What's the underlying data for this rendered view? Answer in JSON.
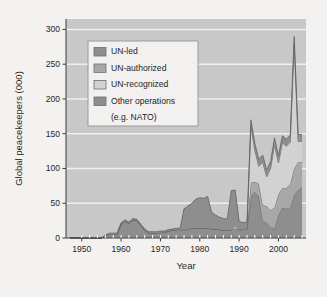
{
  "figure": {
    "background_color": "#f3f2f0",
    "plot_background_color": "#c8c8c8",
    "gridline_color": "#f0f0ee"
  },
  "legend": {
    "name": "series-legend",
    "background_color": "#f2f1ef",
    "border_color": "#9a9a9a",
    "items": [
      {
        "label": "UN-led",
        "color": "#8e8e8e"
      },
      {
        "label": "UN-authorized",
        "color": "#a8a8a8"
      },
      {
        "label": "UN-recognized",
        "color": "#d2d2d2"
      },
      {
        "label": "Other operations",
        "color": "#8e8e8e"
      },
      {
        "label": "(e.g. NATO)",
        "color": ""
      }
    ]
  },
  "chart_data": {
    "type": "area",
    "stacked": true,
    "title": "",
    "xlabel": "Year",
    "ylabel": "Global peacekeepers (000)",
    "xlim": [
      1946,
      2007
    ],
    "ylim": [
      0,
      315
    ],
    "grid": true,
    "legend_position": "upper-left-inside",
    "xticks": [
      1950,
      1960,
      1970,
      1980,
      1990,
      2000
    ],
    "xtick_labels": [
      "1950",
      "1960",
      "1970",
      "1980",
      "1990",
      "2000"
    ],
    "yticks": [
      0,
      50,
      100,
      150,
      200,
      250,
      300
    ],
    "ytick_labels": [
      "0",
      "50",
      "100",
      "150",
      "200",
      "250",
      "300"
    ],
    "x": [
      1947,
      1948,
      1949,
      1950,
      1951,
      1952,
      1953,
      1954,
      1955,
      1956,
      1957,
      1958,
      1959,
      1960,
      1961,
      1962,
      1963,
      1964,
      1965,
      1966,
      1967,
      1968,
      1969,
      1970,
      1971,
      1972,
      1973,
      1974,
      1975,
      1976,
      1977,
      1978,
      1979,
      1980,
      1981,
      1982,
      1983,
      1984,
      1985,
      1986,
      1987,
      1988,
      1989,
      1990,
      1991,
      1992,
      1993,
      1994,
      1995,
      1996,
      1997,
      1998,
      1999,
      2000,
      2001,
      2002,
      2003,
      2004,
      2005,
      2006
    ],
    "series": [
      {
        "name": "UN-led",
        "color": "#8e8e8e",
        "values": [
          0,
          0,
          0,
          0,
          0,
          0,
          0,
          0,
          0,
          3,
          5,
          5,
          5,
          20,
          24,
          21,
          26,
          25,
          18,
          11,
          7,
          7,
          7,
          8,
          8,
          10,
          11,
          12,
          12,
          12,
          12,
          14,
          14,
          14,
          14,
          14,
          13,
          13,
          12,
          11,
          11,
          12,
          14,
          12,
          12,
          13,
          60,
          66,
          60,
          25,
          22,
          16,
          14,
          33,
          44,
          42,
          44,
          62,
          69,
          73
        ]
      },
      {
        "name": "UN-authorized",
        "color": "#a8a8a8",
        "values": [
          0,
          0,
          0,
          0,
          0,
          0,
          0,
          0,
          0,
          0,
          0,
          0,
          0,
          0,
          0,
          0,
          0,
          0,
          0,
          0,
          0,
          0,
          0,
          0,
          0,
          0,
          0,
          0,
          0,
          0,
          0,
          0,
          0,
          0,
          0,
          0,
          0,
          0,
          0,
          0,
          0,
          0,
          0,
          0,
          0,
          0,
          20,
          15,
          18,
          22,
          24,
          24,
          30,
          30,
          28,
          30,
          34,
          38,
          40,
          36
        ]
      },
      {
        "name": "UN-recognized",
        "color": "#d2d2d2",
        "values": [
          0,
          0,
          0,
          0,
          0,
          0,
          0,
          0,
          0,
          0,
          0,
          0,
          0,
          0,
          0,
          0,
          0,
          0,
          0,
          0,
          0,
          0,
          0,
          0,
          0,
          0,
          0,
          0,
          0,
          0,
          0,
          0,
          0,
          0,
          0,
          0,
          0,
          0,
          0,
          0,
          0,
          0,
          3,
          0,
          0,
          0,
          80,
          45,
          25,
          62,
          42,
          60,
          90,
          45,
          65,
          60,
          60,
          180,
          30,
          30
        ]
      },
      {
        "name": "Other operations",
        "color": "#8e8e8e",
        "values": [
          0,
          0,
          0,
          0,
          0,
          0,
          0,
          0,
          0,
          1,
          2,
          2,
          2,
          2,
          2,
          2,
          2,
          2,
          2,
          2,
          2,
          2,
          2,
          2,
          2,
          2,
          2,
          2,
          2,
          30,
          34,
          36,
          42,
          44,
          43,
          46,
          24,
          20,
          18,
          17,
          16,
          56,
          52,
          12,
          10,
          10,
          10,
          10,
          10,
          10,
          10,
          10,
          10,
          10,
          10,
          10,
          10,
          10,
          10,
          10
        ]
      }
    ],
    "totals_note": "Stacked totals peak ~160 in 1993 and ~280 in 2004"
  }
}
